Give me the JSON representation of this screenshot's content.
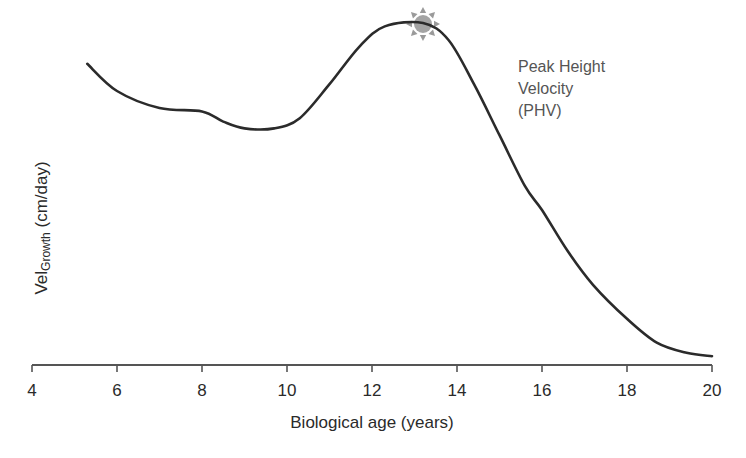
{
  "chart_data": {
    "type": "line",
    "title": "",
    "xlabel": "Biological age (years)",
    "ylabel": "Vel",
    "ylabel_subscript": "Growth",
    "ylabel_unit": "(cm/day)",
    "xlim": [
      4,
      20
    ],
    "ylim": [
      0,
      100
    ],
    "x_ticks": [
      4,
      6,
      8,
      10,
      12,
      14,
      16,
      18,
      20
    ],
    "x_tick_labels": [
      "4",
      "6",
      "8",
      "10",
      "12",
      "14",
      "16",
      "18",
      "20"
    ],
    "y_ticks_shown": false,
    "grid": false,
    "legend": null,
    "series": [
      {
        "name": "Growth velocity",
        "color": "#2b2b2b",
        "x": [
          5.3,
          6,
          7,
          8,
          8.5,
          9,
          9.7,
          10.3,
          11,
          11.7,
          12.3,
          13.2,
          13.8,
          14.4,
          15,
          15.6,
          16,
          16.6,
          17.2,
          18,
          18.7,
          19.4,
          20
        ],
        "y": [
          88,
          80,
          75,
          74,
          71,
          69,
          69,
          72,
          82,
          93,
          99,
          100,
          95,
          82,
          67,
          52,
          45,
          33,
          23,
          13,
          6,
          3,
          2
        ]
      }
    ],
    "annotations": [
      {
        "text": [
          "Peak Height",
          "Velocity",
          "(PHV)"
        ],
        "x": 13.2,
        "y": 100,
        "marker": "sun-burst",
        "marker_color": "#9a9a9a"
      }
    ]
  },
  "labels": {
    "peak_line1": "Peak Height",
    "peak_line2": "Velocity",
    "peak_line3": "(PHV)",
    "xlabel": "Biological age (years)",
    "ylabel_main": "Vel",
    "ylabel_sub": "Growth",
    "ylabel_unit": " (cm/day)"
  }
}
